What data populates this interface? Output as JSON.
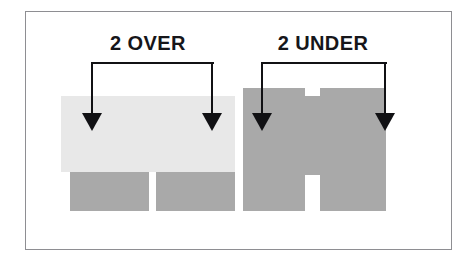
{
  "figure": {
    "background_color": "#ffffff",
    "frame_border_color": "#8e8e92",
    "width": 468,
    "height": 265
  },
  "palette": {
    "light_course": "#e8e8e8",
    "dark_course": "#a9a9a9",
    "ink": "#111114",
    "text": "#16161a",
    "white": "#ffffff"
  },
  "annotations": [
    {
      "id": "over",
      "label": "2 OVER",
      "label_x": 148,
      "label_y": 32,
      "bracket": {
        "top_y": 62,
        "left_x": 92,
        "right_x": 212,
        "bottom_y": 114
      },
      "arrow_targets": [
        92,
        212
      ]
    },
    {
      "id": "under",
      "label": "2 UNDER",
      "label_x": 323,
      "label_y": 32,
      "bracket": {
        "top_y": 62,
        "left_x": 262,
        "right_x": 385,
        "bottom_y": 114
      },
      "arrow_targets": [
        262,
        385
      ]
    }
  ],
  "courses": {
    "light_band": {
      "name": "light-course-band",
      "x": 61,
      "y": 96,
      "width": 174,
      "height": 76
    },
    "lower_blocks": [
      {
        "name": "lower-block-left",
        "x": 70,
        "y": 172,
        "width": 79,
        "height": 39
      },
      {
        "name": "lower-block-right",
        "x": 156,
        "y": 172,
        "width": 79,
        "height": 39
      }
    ],
    "tall_blocks": [
      {
        "name": "tall-block-left",
        "x": 243,
        "y": 88,
        "width": 62,
        "height": 123
      },
      {
        "name": "tall-block-right",
        "x": 320,
        "y": 88,
        "width": 66,
        "height": 123
      }
    ],
    "joint_fill": {
      "name": "joint-fill-between-tall-blocks",
      "x": 305,
      "y": 96,
      "width": 15,
      "height": 79
    }
  },
  "legend_note": ""
}
